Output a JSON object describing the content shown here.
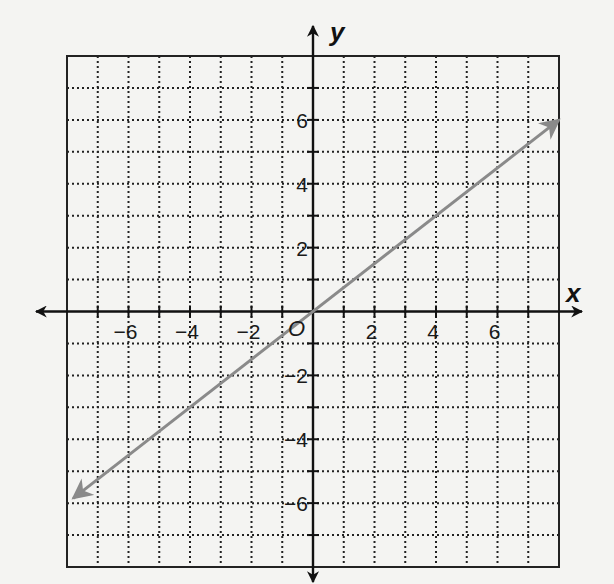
{
  "chart_data": {
    "type": "line",
    "title": "",
    "xlabel": "x",
    "ylabel": "y",
    "origin_label": "O",
    "xlim": [
      -8,
      8
    ],
    "ylim": [
      -8,
      8
    ],
    "grid": true,
    "grid_style": "dotted",
    "x_tick_labels": [
      {
        "value": -6,
        "label": "−6"
      },
      {
        "value": -4,
        "label": "−4"
      },
      {
        "value": -2,
        "label": "−2"
      },
      {
        "value": 2,
        "label": "2"
      },
      {
        "value": 4,
        "label": "4"
      },
      {
        "value": 6,
        "label": "6"
      }
    ],
    "y_tick_labels": [
      {
        "value": 6,
        "label": "6"
      },
      {
        "value": 4,
        "label": "4"
      },
      {
        "value": 2,
        "label": "2"
      },
      {
        "value": -2,
        "label": "−2"
      },
      {
        "value": -4,
        "label": "−4"
      },
      {
        "value": -6,
        "label": "−6"
      }
    ],
    "series": [
      {
        "name": "line",
        "equation": "y = 0.75x",
        "slope": 0.75,
        "intercept": 0,
        "x": [
          -7.8,
          8
        ],
        "y": [
          -5.85,
          6
        ],
        "color": "#8a8a8a",
        "arrows": "both"
      }
    ],
    "colors": {
      "axis": "#111111",
      "grid": "#222222",
      "line": "#8a8a8a"
    }
  }
}
